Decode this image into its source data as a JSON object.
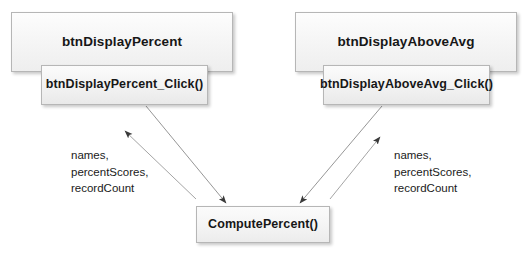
{
  "diagram": {
    "type": "call-flow",
    "background_color": "#ffffff",
    "nodes": [
      {
        "id": "btnDisplayPercent",
        "label": "btnDisplayPercent",
        "kind": "control"
      },
      {
        "id": "btnDisplayPercentClick",
        "label": "btnDisplayPercent_Click()",
        "kind": "event-handler"
      },
      {
        "id": "btnDisplayAboveAvg",
        "label": "btnDisplayAboveAvg",
        "kind": "control"
      },
      {
        "id": "btnDisplayAboveAvgClick",
        "label": "btnDisplayAboveAvg_Click()",
        "kind": "event-handler"
      },
      {
        "id": "computePercent",
        "label": "ComputePercent()",
        "kind": "method"
      }
    ],
    "edge_labels": {
      "left": [
        "names,",
        "percentScores,",
        "recordCount"
      ],
      "right": [
        "names,",
        "percentScores,",
        "recordCount"
      ]
    },
    "edges": [
      {
        "from": "btnDisplayPercentClick",
        "to": "computePercent",
        "direction": "call"
      },
      {
        "from": "computePercent",
        "to": "btnDisplayPercentClick",
        "direction": "return"
      },
      {
        "from": "btnDisplayAboveAvgClick",
        "to": "computePercent",
        "direction": "call"
      },
      {
        "from": "computePercent",
        "to": "btnDisplayAboveAvgClick",
        "direction": "return"
      }
    ],
    "colors": {
      "node_border": "#b6b6b6",
      "node_fill_top": "#fdfdfd",
      "node_fill_bottom": "#eeeeee",
      "arrow": "#5a5a5a",
      "text": "#1a1a1a"
    }
  }
}
